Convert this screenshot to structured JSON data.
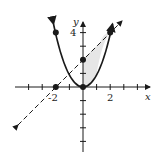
{
  "diagram": {
    "type": "coordinate-plane",
    "axes": {
      "x_label": "x",
      "y_label": "y",
      "x_tick_label": "2",
      "x_neg_tick_label": "-2",
      "y_tick_label": "4"
    },
    "curves": [
      {
        "name": "parabola",
        "equation": "y = x^2",
        "style": "solid",
        "arrows": "both"
      },
      {
        "name": "line",
        "equation": "y = x + 2",
        "style": "dashed",
        "arrows": "both"
      }
    ],
    "shaded_region": {
      "between": [
        "y = x + 2",
        "y = x^2"
      ],
      "x_from": 0,
      "x_to": 2,
      "color": "#e8e8e8"
    },
    "points": [
      {
        "x": -2,
        "y": 4
      },
      {
        "x": 2,
        "y": 4
      },
      {
        "x": 0,
        "y": 2
      },
      {
        "x": 0,
        "y": 0
      },
      {
        "x": -2,
        "y": 0
      }
    ],
    "colors": {
      "stroke": "#1a1a1a",
      "shade": "#e8e8e8"
    }
  }
}
